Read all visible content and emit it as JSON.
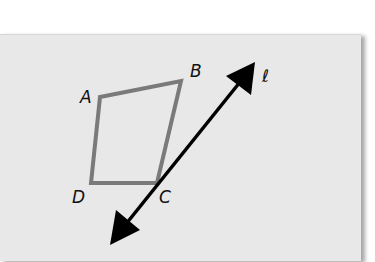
{
  "diagram": {
    "type": "geometry-reflection-setup",
    "quadrilateral": {
      "vertices": [
        {
          "label": "A",
          "x": 100,
          "y": 97
        },
        {
          "label": "B",
          "x": 181,
          "y": 81
        },
        {
          "label": "C",
          "x": 157,
          "y": 183
        },
        {
          "label": "D",
          "x": 91,
          "y": 183
        }
      ],
      "stroke_color": "#7a7a7a"
    },
    "line": {
      "label": "ℓ",
      "from": {
        "x": 110,
        "y": 245
      },
      "to": {
        "x": 255,
        "y": 62
      },
      "color": "#000000",
      "arrows": "both"
    },
    "background_color": "#e8e8e8"
  },
  "labels": {
    "A": "A",
    "B": "B",
    "C": "C",
    "D": "D",
    "line": "ℓ"
  }
}
